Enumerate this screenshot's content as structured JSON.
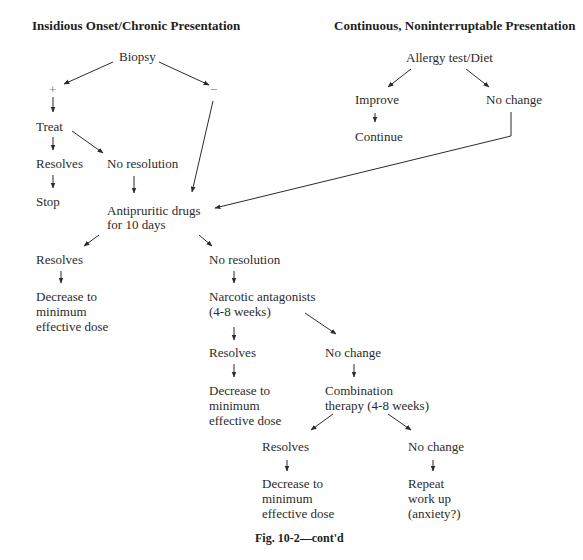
{
  "diagram": {
    "type": "flowchart",
    "caption": "Fig. 10-2—cont'd",
    "left_section": {
      "title": "Insidious Onset/Chronic Presentation",
      "nodes": {
        "biopsy": "Biopsy",
        "plus": "+",
        "minus": "−",
        "treat": "Treat",
        "resolves1": "Resolves",
        "no_resolution1": "No resolution",
        "stop": "Stop",
        "antipruritic_l1": "Antipruritic drugs",
        "antipruritic_l2": "for 10 days",
        "resolves2": "Resolves",
        "decrease1_l1": "Decrease to",
        "decrease1_l2": "minimum",
        "decrease1_l3": "effective dose",
        "no_resolution2": "No resolution",
        "narcotic_l1": "Narcotic antagonists",
        "narcotic_l2": "(4-8 weeks)",
        "resolves3": "Resolves",
        "decrease2_l1": "Decrease to",
        "decrease2_l2": "minimum",
        "decrease2_l3": "effective dose",
        "no_change1": "No change",
        "combination_l1": "Combination",
        "combination_l2": "therapy (4-8 weeks)",
        "resolves4": "Resolves",
        "decrease3_l1": "Decrease to",
        "decrease3_l2": "minimum",
        "decrease3_l3": "effective dose",
        "no_change2": "No change",
        "repeat_l1": "Repeat",
        "repeat_l2": "work up",
        "repeat_l3": "(anxiety?)"
      }
    },
    "right_section": {
      "title": "Continuous, Noninterruptable Presentation",
      "nodes": {
        "allergy": "Allergy test/Diet",
        "improve": "Improve",
        "no_change": "No change",
        "continue": "Continue"
      }
    },
    "edges": [
      [
        "Biopsy",
        "+"
      ],
      [
        "Biopsy",
        "−"
      ],
      [
        "+",
        "Treat"
      ],
      [
        "Treat",
        "Resolves"
      ],
      [
        "Treat",
        "No resolution"
      ],
      [
        "Resolves",
        "Stop"
      ],
      [
        "No resolution",
        "Antipruritic drugs for 10 days"
      ],
      [
        "−",
        "Antipruritic drugs for 10 days"
      ],
      [
        "Allergy test/Diet",
        "Improve"
      ],
      [
        "Allergy test/Diet",
        "No change"
      ],
      [
        "Improve",
        "Continue"
      ],
      [
        "No change",
        "Antipruritic drugs for 10 days"
      ],
      [
        "Antipruritic drugs for 10 days",
        "Resolves"
      ],
      [
        "Antipruritic drugs for 10 days",
        "No resolution"
      ],
      [
        "Resolves",
        "Decrease to minimum effective dose"
      ],
      [
        "No resolution",
        "Narcotic antagonists (4-8 weeks)"
      ],
      [
        "Narcotic antagonists (4-8 weeks)",
        "Resolves"
      ],
      [
        "Narcotic antagonists (4-8 weeks)",
        "No change"
      ],
      [
        "Resolves",
        "Decrease to minimum effective dose"
      ],
      [
        "No change",
        "Combination therapy (4-8 weeks)"
      ],
      [
        "Combination therapy (4-8 weeks)",
        "Resolves"
      ],
      [
        "Combination therapy (4-8 weeks)",
        "No change"
      ],
      [
        "Resolves",
        "Decrease to minimum effective dose"
      ],
      [
        "No change",
        "Repeat work up (anxiety?)"
      ]
    ]
  }
}
